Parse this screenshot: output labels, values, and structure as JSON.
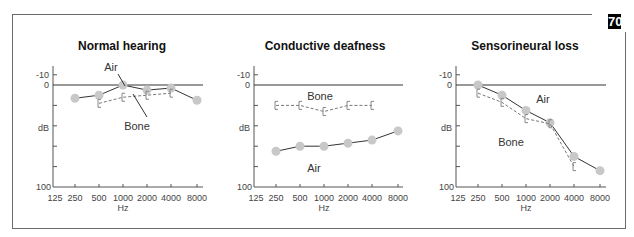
{
  "page_tab": "70",
  "chart_data": [
    {
      "type": "line",
      "title": "Normal hearing",
      "xlabel": "Hz",
      "ylabel": "dB",
      "x_ticks": [
        "125",
        "250",
        "500",
        "1000",
        "2000",
        "4000",
        "8000"
      ],
      "y_tick_labels": [
        "-10",
        "0",
        "dB",
        "100"
      ],
      "ylim": [
        -10,
        100
      ],
      "y_inverted": true,
      "grid": false,
      "reference_line": 0,
      "series": [
        {
          "name": "Air",
          "marker": "circle",
          "style": "solid",
          "x": [
            "250",
            "500",
            "1000",
            "2000",
            "4000",
            "8000"
          ],
          "values": [
            13,
            10,
            0,
            5,
            3,
            15
          ]
        },
        {
          "name": "Bone",
          "marker": "bracket",
          "style": "dashed",
          "x": [
            "500",
            "1000",
            "2000",
            "4000"
          ],
          "values": [
            18,
            12,
            10,
            8
          ]
        }
      ],
      "annotations": [
        "Air",
        "Bone"
      ]
    },
    {
      "type": "line",
      "title": "Conductive deafness",
      "xlabel": "Hz",
      "ylabel": "dB",
      "x_ticks": [
        "125",
        "250",
        "500",
        "1000",
        "2000",
        "4000",
        "8000"
      ],
      "y_tick_labels": [
        "-10",
        "0",
        "dB",
        "100"
      ],
      "ylim": [
        -10,
        100
      ],
      "y_inverted": true,
      "grid": false,
      "reference_line": 0,
      "series": [
        {
          "name": "Air",
          "marker": "circle",
          "style": "solid",
          "x": [
            "250",
            "500",
            "1000",
            "2000",
            "4000",
            "8000"
          ],
          "values": [
            65,
            60,
            60,
            57,
            54,
            45
          ]
        },
        {
          "name": "Bone",
          "marker": "bracket",
          "style": "dashed",
          "x": [
            "250",
            "500",
            "1000",
            "2000",
            "4000"
          ],
          "values": [
            20,
            20,
            26,
            20,
            20
          ]
        }
      ],
      "annotations": [
        "Bone",
        "Air"
      ]
    },
    {
      "type": "line",
      "title": "Sensorineural loss",
      "xlabel": "Hz",
      "ylabel": "dB",
      "x_ticks": [
        "125",
        "250",
        "500",
        "1000",
        "2000",
        "4000",
        "8000"
      ],
      "y_tick_labels": [
        "-10",
        "0",
        "dB",
        "100"
      ],
      "ylim": [
        -10,
        100
      ],
      "y_inverted": true,
      "grid": false,
      "reference_line": 0,
      "series": [
        {
          "name": "Air",
          "marker": "circle",
          "style": "solid",
          "x": [
            "250",
            "500",
            "1000",
            "2000",
            "4000",
            "8000"
          ],
          "values": [
            0,
            10,
            25,
            37,
            70,
            84
          ]
        },
        {
          "name": "Bone",
          "marker": "bracket",
          "style": "dashed",
          "x": [
            "250",
            "500",
            "1000",
            "2000",
            "4000"
          ],
          "values": [
            8,
            17,
            33,
            38,
            80
          ]
        }
      ],
      "annotations": [
        "Air",
        "Bone"
      ]
    }
  ]
}
